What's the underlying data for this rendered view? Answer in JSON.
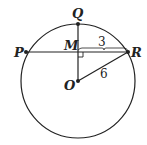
{
  "diagram": {
    "type": "circle-geometry",
    "points": {
      "P": {
        "label": "P"
      },
      "Q": {
        "label": "Q"
      },
      "M": {
        "label": "M"
      },
      "R": {
        "label": "R"
      },
      "O": {
        "label": "O"
      }
    },
    "segments": [
      {
        "from": "P",
        "to": "R",
        "note": "chord"
      },
      {
        "from": "Q",
        "to": "O"
      },
      {
        "from": "M",
        "to": "R",
        "length_label": "3"
      },
      {
        "from": "O",
        "to": "R",
        "length_label": "6"
      }
    ],
    "right_angle_at": "M",
    "labels": {
      "mr_length": "3",
      "or_length": "6"
    },
    "colors": {
      "stroke": "#222222",
      "background": "#ffffff"
    }
  }
}
